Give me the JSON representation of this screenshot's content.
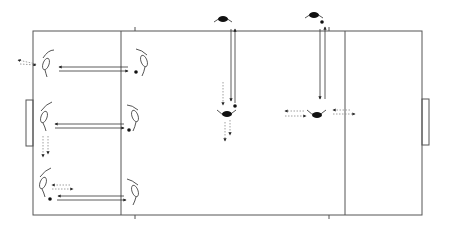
{
  "diagram": {
    "type": "soccer-drill-field",
    "colors": {
      "line": "#555555",
      "pass": "#333333",
      "run": "#888888",
      "ball": "#111111",
      "dark_player": "#111111"
    },
    "field": {
      "x": 33,
      "y": 31,
      "width": 389,
      "height": 184
    },
    "zone_lines_x": [
      121,
      345
    ],
    "goals": [
      {
        "side": "left",
        "x": 26,
        "y": 100,
        "width": 7,
        "height": 46
      },
      {
        "side": "right",
        "x": 422,
        "y": 99,
        "width": 7,
        "height": 46
      }
    ],
    "light_players": [
      {
        "id": "L1",
        "x": 46,
        "y": 63
      },
      {
        "id": "L2",
        "x": 45,
        "y": 120
      },
      {
        "id": "L3",
        "x": 43,
        "y": 183
      },
      {
        "id": "R1",
        "x": 144,
        "y": 61
      },
      {
        "id": "R2",
        "x": 134,
        "y": 116
      },
      {
        "id": "R3",
        "x": 134,
        "y": 190
      }
    ],
    "dark_players": [
      {
        "id": "D1",
        "x": 223,
        "y": 18
      },
      {
        "id": "D2",
        "x": 315,
        "y": 15
      },
      {
        "id": "D3",
        "x": 228,
        "y": 114
      },
      {
        "id": "D4",
        "x": 317,
        "y": 114
      }
    ],
    "balls": [
      {
        "x": 136,
        "y": 72
      },
      {
        "x": 128,
        "y": 130
      },
      {
        "x": 50,
        "y": 199
      },
      {
        "x": 235,
        "y": 106
      },
      {
        "x": 322,
        "y": 22
      }
    ]
  }
}
